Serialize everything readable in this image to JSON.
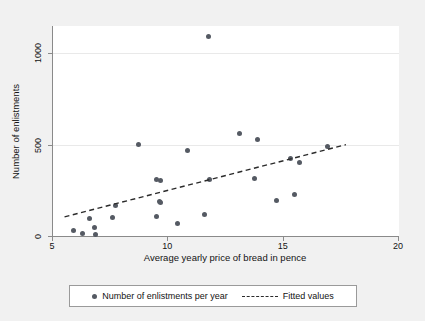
{
  "chart_data": {
    "type": "scatter",
    "title": "",
    "xlabel": "Average yearly price of bread in pence",
    "ylabel": "Number of enlistments",
    "xlim": [
      5,
      20
    ],
    "ylim": [
      0,
      1150
    ],
    "grid": true,
    "xticks": [
      5,
      10,
      15,
      20
    ],
    "yticks": [
      0,
      500,
      1000
    ],
    "legend_position": "bottom",
    "series": [
      {
        "name": "Number of enlistments per year",
        "type": "scatter",
        "marker": "circle",
        "color": "#555a63",
        "points": [
          [
            5.9,
            30
          ],
          [
            6.3,
            12
          ],
          [
            6.6,
            95
          ],
          [
            6.8,
            45
          ],
          [
            6.85,
            10
          ],
          [
            7.6,
            100
          ],
          [
            7.7,
            165
          ],
          [
            8.7,
            500
          ],
          [
            9.5,
            310
          ],
          [
            9.65,
            305
          ],
          [
            9.6,
            190
          ],
          [
            9.65,
            185
          ],
          [
            9.5,
            105
          ],
          [
            10.4,
            70
          ],
          [
            10.85,
            470
          ],
          [
            11.55,
            120
          ],
          [
            11.75,
            1090
          ],
          [
            11.8,
            310
          ],
          [
            13.1,
            560
          ],
          [
            13.85,
            530
          ],
          [
            13.75,
            315
          ],
          [
            14.7,
            195
          ],
          [
            15.3,
            425
          ],
          [
            15.45,
            225
          ],
          [
            15.7,
            400
          ],
          [
            16.9,
            490
          ]
        ]
      },
      {
        "name": "Fitted values",
        "type": "line",
        "style": "dashed",
        "color": "#2b2b2b",
        "endpoints": [
          [
            5.5,
            105
          ],
          [
            17.7,
            500
          ]
        ]
      }
    ]
  },
  "legend": {
    "scatter_label": "Number of enlistments per year",
    "fit_label": "Fitted values"
  },
  "axes": {
    "x_tick_labels": [
      "5",
      "10",
      "15",
      "20"
    ],
    "y_tick_labels": [
      "0",
      "500",
      "1000"
    ]
  }
}
